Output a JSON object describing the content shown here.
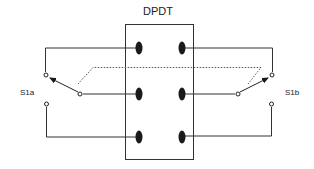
{
  "diagram": {
    "title": "DPDT",
    "switches": [
      {
        "id": "s1a",
        "label": "S1a"
      },
      {
        "id": "s1b",
        "label": "S1b"
      }
    ],
    "colors": {
      "line": "#333333",
      "contact": "#1a1a1a",
      "dotted_link": "#555555",
      "background": "#ffffff"
    }
  }
}
